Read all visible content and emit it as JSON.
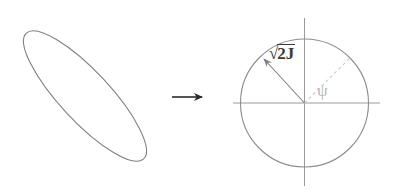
{
  "figure": {
    "background_color": "#ffffff",
    "width": 404,
    "height": 196,
    "stroke_color": "#808080",
    "axis_color": "#9a9a9a",
    "dashed_color": "#c9c9c9",
    "arrow_color": "#2b2b2b",
    "label_dark_color": "#3a3a3a",
    "label_light_color": "#b9b9b9"
  },
  "left_panel": {
    "name": "phase-space-ellipse",
    "shape": "ellipse",
    "center": {
      "x": 85,
      "y": 96
    },
    "semi_major": 86,
    "semi_minor": 25,
    "rotation_deg": 47,
    "stroke_color": "#808080",
    "stroke_width": 1.1,
    "fill": "none"
  },
  "transform_arrow": {
    "name": "transform-arrow",
    "direction": "right",
    "x_start": 172,
    "x_end": 204,
    "y": 97,
    "color": "#2b2b2b"
  },
  "right_panel": {
    "name": "action-angle-circle",
    "circle": {
      "center": {
        "x": 304.5,
        "y": 103
      },
      "radius": 64,
      "stroke_color": "#8d8d8d",
      "stroke_width": 1.1,
      "fill": "none"
    },
    "axes": {
      "horizontal": {
        "x1": 233,
        "y1": 103,
        "x2": 380,
        "y2": 103
      },
      "vertical": {
        "x1": 304.5,
        "y1": 18,
        "x2": 304.5,
        "y2": 186
      },
      "color": "#9a9a9a",
      "stroke_width": 1.0
    },
    "radius_vector": {
      "name": "radius-vector",
      "from": {
        "x": 304.5,
        "y": 103
      },
      "to": {
        "x": 262,
        "y": 57
      },
      "color": "#7f7f7f",
      "has_arrowhead": true,
      "label": "√2J",
      "label_radical": "√",
      "label_radicand": "2J"
    },
    "angle_ray": {
      "name": "angle-ray-dashed",
      "from": {
        "x": 304.5,
        "y": 103
      },
      "to": {
        "x": 350,
        "y": 58
      },
      "color": "#c9c9c9",
      "dash_pattern": "3,3",
      "angle_label": "ψ"
    },
    "baseline_dashed": {
      "name": "angle-baseline-dashed",
      "from": {
        "x": 304.5,
        "y": 103
      },
      "to": {
        "x": 370,
        "y": 103
      },
      "color": "#cfcfcf",
      "dash_pattern": "3,3"
    }
  },
  "labels": {
    "radius_label": "√2J",
    "radius_radical_glyph": "√",
    "radius_radicand": "2J",
    "angle_label": "ψ"
  }
}
